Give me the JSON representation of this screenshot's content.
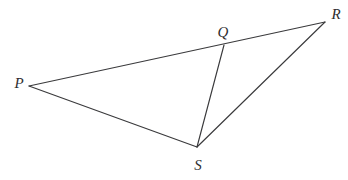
{
  "figure": {
    "type": "geometry-diagram",
    "background_color": "#ffffff",
    "stroke_color": "#3a3a3c",
    "label_color": "#2e2e30",
    "canvas": {
      "width": 348,
      "height": 180
    },
    "points": [
      {
        "id": "P",
        "label": "P",
        "x": 29,
        "y": 86,
        "label_x": 19,
        "label_y": 88
      },
      {
        "id": "Q",
        "label": "Q",
        "x": 224,
        "y": 45,
        "label_x": 223,
        "label_y": 37
      },
      {
        "id": "R",
        "label": "R",
        "x": 325,
        "y": 22,
        "label_x": 336,
        "label_y": 19
      },
      {
        "id": "S",
        "label": "S",
        "x": 197,
        "y": 147,
        "label_x": 198,
        "label_y": 170
      }
    ],
    "segments": [
      {
        "id": "PR",
        "from": "P",
        "to": "R",
        "note": "Q lies on this segment"
      },
      {
        "id": "PS",
        "from": "P",
        "to": "S"
      },
      {
        "id": "SR",
        "from": "S",
        "to": "R"
      },
      {
        "id": "QS",
        "from": "Q",
        "to": "S",
        "note": "cevian dividing figure into triangle PQS and triangle QRS"
      }
    ]
  }
}
